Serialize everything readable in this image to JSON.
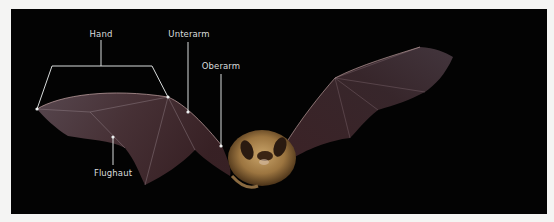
{
  "figure": {
    "background_color": "#030303",
    "label_color": "#d9dcdc",
    "labels": [
      {
        "id": "hand",
        "text": "Hand"
      },
      {
        "id": "unterarm",
        "text": "Unterarm"
      },
      {
        "id": "oberarm",
        "text": "Oberarm"
      },
      {
        "id": "flughaut",
        "text": "Flughaut"
      }
    ]
  }
}
